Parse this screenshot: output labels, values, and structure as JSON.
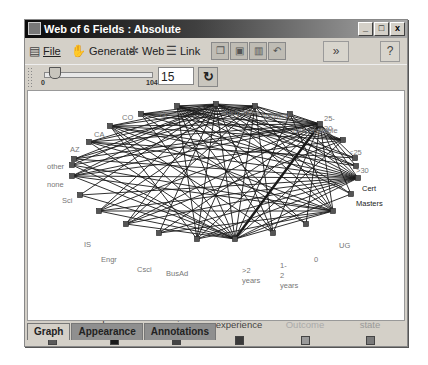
{
  "window": {
    "title": "Web of 6 Fields : Absolute",
    "controls": {
      "minimize": "_",
      "maximize": "□",
      "close": "x"
    }
  },
  "menubar": {
    "items": [
      {
        "label": "File",
        "icon": "file-icon"
      },
      {
        "label": "Generate",
        "icon": "generate-icon"
      },
      {
        "label": "Web",
        "icon": "web-icon"
      },
      {
        "label": "Link",
        "icon": "link-icon"
      }
    ],
    "toolbar_buttons": [
      "copy-icon",
      "export-icon",
      "print-icon",
      "undo-icon"
    ],
    "expand_label": "»",
    "help_label": "?"
  },
  "slider": {
    "min": "0",
    "max": "104",
    "value": "15",
    "refresh_label": "↻"
  },
  "graph": {
    "nodes": [
      {
        "id": "CO",
        "label": "CO",
        "x": 141,
        "y": 114,
        "lx": 98,
        "ly": 94,
        "dark": false
      },
      {
        "id": "CA",
        "label": "CA",
        "x": 110,
        "y": 126,
        "lx": 70,
        "ly": 111,
        "dark": false
      },
      {
        "id": "AZ",
        "label": "AZ",
        "x": 89,
        "y": 142,
        "lx": 46,
        "ly": 126,
        "dark": false
      },
      {
        "id": "other",
        "label": "other",
        "x": 74,
        "y": 159,
        "lx": 23,
        "ly": 143,
        "dark": false
      },
      {
        "id": "none",
        "label": "none",
        "x": 72,
        "y": 165,
        "lx": 23,
        "ly": 161,
        "dark": false
      },
      {
        "id": "Sci",
        "label": "Sci",
        "x": 72,
        "y": 176,
        "lx": 38,
        "ly": 177,
        "dark": false
      },
      {
        "id": "n_IS",
        "label": "IS",
        "x": 80,
        "y": 195,
        "lx": 60,
        "ly": 221,
        "dark": false
      },
      {
        "id": "Engr",
        "label": "Engr",
        "x": 99,
        "y": 211,
        "lx": 77,
        "ly": 236,
        "dark": false
      },
      {
        "id": "Csci",
        "label": "Csci",
        "x": 126,
        "y": 224,
        "lx": 113,
        "ly": 246,
        "dark": false
      },
      {
        "id": "n_x",
        "label": "",
        "x": 159,
        "y": 233,
        "lx": 0,
        "ly": 0,
        "dark": false
      },
      {
        "id": "BusAd",
        "label": "BusAd",
        "x": 197,
        "y": 239,
        "lx": 142,
        "ly": 250,
        "dark": false
      },
      {
        "id": "gt2",
        "label": ">2\nyears",
        "x": 235,
        "y": 239,
        "lx": 218,
        "ly": 247,
        "dark": false
      },
      {
        "id": "y12",
        "label": "1-\n2\nyears",
        "x": 273,
        "y": 233,
        "lx": 256,
        "ly": 242,
        "dark": false
      },
      {
        "id": "zero",
        "label": "0",
        "x": 306,
        "y": 224,
        "lx": 290,
        "ly": 236,
        "dark": false
      },
      {
        "id": "UG",
        "label": "UG",
        "x": 333,
        "y": 211,
        "lx": 315,
        "ly": 222,
        "dark": false
      },
      {
        "id": "n_y",
        "label": "",
        "x": 351,
        "y": 194,
        "lx": 0,
        "ly": 0,
        "dark": false
      },
      {
        "id": "Masters",
        "label": "Masters",
        "x": 358,
        "y": 178,
        "lx": 332,
        "ly": 180,
        "dark": true
      },
      {
        "id": "Cert",
        "label": "Cert",
        "x": 356,
        "y": 166,
        "lx": 338,
        "ly": 165,
        "dark": true
      },
      {
        "id": "gt30",
        "label": ">30",
        "x": 355,
        "y": 158,
        "lx": 332,
        "ly": 147,
        "dark": false
      },
      {
        "id": "lt25",
        "label": "<25",
        "x": 343,
        "y": 140,
        "lx": 325,
        "ly": 129,
        "dark": false
      },
      {
        "id": "a2530",
        "label": "25-\n30",
        "x": 320,
        "y": 124,
        "lx": 300,
        "ly": 95,
        "dark": false
      },
      {
        "id": "unacc",
        "label": "unacceptable",
        "x": 290,
        "y": 114,
        "lx": 269,
        "ly": 107,
        "dark": false
      },
      {
        "id": "minimal",
        "label": "minimal",
        "x": 255,
        "y": 106,
        "lx": 239,
        "ly": 92,
        "dark": false
      },
      {
        "id": "adequate",
        "label": "adequate",
        "x": 216,
        "y": 104,
        "lx": 198,
        "ly": 89,
        "dark": false
      },
      {
        "id": "TX",
        "label": "TX",
        "x": 177,
        "y": 106,
        "lx": 134,
        "ly": 91,
        "dark": false
      }
    ],
    "edges": [
      [
        "CO",
        "adequate"
      ],
      [
        "CO",
        "minimal"
      ],
      [
        "CO",
        "unacc"
      ],
      [
        "CO",
        "a2530"
      ],
      [
        "CO",
        "Masters"
      ],
      [
        "CO",
        "gt2"
      ],
      [
        "CO",
        "zero"
      ],
      [
        "CO",
        "lt25"
      ],
      [
        "CA",
        "adequate"
      ],
      [
        "CA",
        "minimal"
      ],
      [
        "CA",
        "a2530"
      ],
      [
        "CA",
        "lt25"
      ],
      [
        "CA",
        "Masters"
      ],
      [
        "CA",
        "UG"
      ],
      [
        "CA",
        "gt2"
      ],
      [
        "CA",
        "y12"
      ],
      [
        "CA",
        "BusAd"
      ],
      [
        "CA",
        "Cert"
      ],
      [
        "AZ",
        "adequate"
      ],
      [
        "AZ",
        "minimal"
      ],
      [
        "AZ",
        "a2530"
      ],
      [
        "AZ",
        "Masters"
      ],
      [
        "AZ",
        "gt2"
      ],
      [
        "AZ",
        "UG"
      ],
      [
        "AZ",
        "gt30"
      ],
      [
        "other",
        "adequate"
      ],
      [
        "other",
        "a2530"
      ],
      [
        "other",
        "Masters"
      ],
      [
        "other",
        "gt2"
      ],
      [
        "other",
        "minimal"
      ],
      [
        "none",
        "adequate"
      ],
      [
        "none",
        "a2530"
      ],
      [
        "none",
        "UG"
      ],
      [
        "none",
        "gt2"
      ],
      [
        "Sci",
        "adequate"
      ],
      [
        "Sci",
        "a2530"
      ],
      [
        "Sci",
        "Masters"
      ],
      [
        "Sci",
        "gt2"
      ],
      [
        "Sci",
        "minimal"
      ],
      [
        "Sci",
        "UG"
      ],
      [
        "Sci",
        "lt25"
      ],
      [
        "n_IS",
        "adequate"
      ],
      [
        "n_IS",
        "gt2"
      ],
      [
        "n_IS",
        "Masters"
      ],
      [
        "Engr",
        "adequate"
      ],
      [
        "Engr",
        "a2530"
      ],
      [
        "Engr",
        "Masters"
      ],
      [
        "Engr",
        "gt2"
      ],
      [
        "Engr",
        "UG"
      ],
      [
        "Engr",
        "minimal"
      ],
      [
        "Csci",
        "adequate"
      ],
      [
        "Csci",
        "a2530"
      ],
      [
        "Csci",
        "Masters"
      ],
      [
        "Csci",
        "gt2"
      ],
      [
        "Csci",
        "minimal"
      ],
      [
        "Csci",
        "lt25"
      ],
      [
        "n_x",
        "adequate"
      ],
      [
        "n_x",
        "a2530"
      ],
      [
        "n_x",
        "Masters"
      ],
      [
        "n_x",
        "UG"
      ],
      [
        "BusAd",
        "adequate"
      ],
      [
        "BusAd",
        "a2530"
      ],
      [
        "BusAd",
        "Masters"
      ],
      [
        "BusAd",
        "minimal"
      ],
      [
        "BusAd",
        "UG"
      ],
      [
        "BusAd",
        "TX"
      ],
      [
        "gt2",
        "adequate"
      ],
      [
        "gt2",
        "a2530"
      ],
      [
        "gt2",
        "Masters"
      ],
      [
        "gt2",
        "UG"
      ],
      [
        "gt2",
        "lt25"
      ],
      [
        "gt2",
        "TX"
      ],
      [
        "gt2",
        "n_y"
      ],
      [
        "gt2",
        "minimal"
      ],
      [
        "gt2",
        "unacc"
      ],
      [
        "y12",
        "adequate"
      ],
      [
        "y12",
        "a2530"
      ],
      [
        "y12",
        "TX"
      ],
      [
        "y12",
        "minimal"
      ],
      [
        "zero",
        "a2530"
      ],
      [
        "zero",
        "TX"
      ],
      [
        "UG",
        "adequate"
      ],
      [
        "UG",
        "a2530"
      ],
      [
        "UG",
        "TX"
      ],
      [
        "UG",
        "minimal"
      ],
      [
        "UG",
        "unacc"
      ],
      [
        "n_y",
        "adequate"
      ],
      [
        "n_y",
        "a2530"
      ],
      [
        "n_y",
        "TX"
      ],
      [
        "Masters",
        "adequate"
      ],
      [
        "Masters",
        "a2530"
      ],
      [
        "Masters",
        "TX"
      ],
      [
        "Masters",
        "minimal"
      ],
      [
        "Masters",
        "unacc"
      ],
      [
        "Cert",
        "adequate"
      ],
      [
        "Cert",
        "a2530"
      ],
      [
        "Cert",
        "TX"
      ],
      [
        "gt30",
        "adequate"
      ],
      [
        "gt30",
        "a2530"
      ],
      [
        "gt30",
        "TX"
      ],
      [
        "lt25",
        "adequate"
      ],
      [
        "lt25",
        "TX"
      ],
      [
        "lt25",
        "minimal"
      ],
      [
        "a2530",
        "adequate"
      ],
      [
        "a2530",
        "TX"
      ],
      [
        "a2530",
        "minimal"
      ],
      [
        "a2530",
        "unacc"
      ],
      [
        "TX",
        "adequate"
      ],
      [
        "TX",
        "minimal"
      ],
      [
        "adequate",
        "minimal"
      ]
    ],
    "thick_edges": [
      [
        "gt2",
        "a2530"
      ]
    ]
  },
  "legend": [
    {
      "label": "age",
      "color": "#5a5a5a",
      "text_color": "#777777"
    },
    {
      "label": "degree",
      "color": "#1a1a1a",
      "text_color": "#333333"
    },
    {
      "label": "major",
      "color": "#444444",
      "text_color": "#555555"
    },
    {
      "label": "experience",
      "color": "#3a3a3a",
      "text_color": "#444444"
    },
    {
      "label": "Outcome",
      "color": "#9a9a9a",
      "text_color": "#aaaaaa"
    },
    {
      "label": "state",
      "color": "#7a7a7a",
      "text_color": "#999999"
    }
  ],
  "tabs": [
    {
      "label": "Graph",
      "active": true
    },
    {
      "label": "Appearance",
      "active": false
    },
    {
      "label": "Annotations",
      "active": false
    }
  ]
}
